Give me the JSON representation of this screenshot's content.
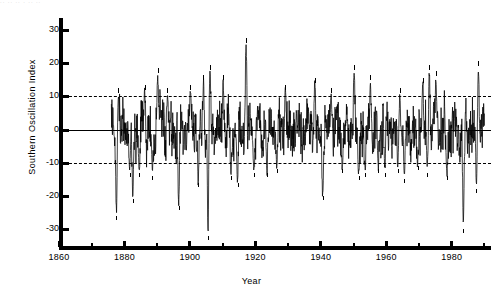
{
  "figure": {
    "top_artifact_text": "·· ·· ·· · ·· ··",
    "xlabel": "Year",
    "ylabel": "Southern Oscillation Index"
  },
  "axes": {
    "y_ticks": [
      {
        "value": 30,
        "label": "30"
      },
      {
        "value": 20,
        "label": "20"
      },
      {
        "value": 10,
        "label": "10"
      },
      {
        "value": 0,
        "label": "0"
      },
      {
        "value": -10,
        "label": "-10"
      },
      {
        "value": -20,
        "label": "-20"
      },
      {
        "value": -30,
        "label": "-30"
      }
    ],
    "x_ticks_major": [
      {
        "value": 1860,
        "label": "1860"
      },
      {
        "value": 1880,
        "label": "1880"
      },
      {
        "value": 1900,
        "label": "1900"
      },
      {
        "value": 1920,
        "label": "1920"
      },
      {
        "value": 1940,
        "label": "1940"
      },
      {
        "value": 1960,
        "label": "1960"
      },
      {
        "value": 1980,
        "label": "1980"
      }
    ],
    "x_ticks_minor": [
      1870,
      1890,
      1910,
      1930,
      1950,
      1970,
      1990
    ]
  },
  "chart_data": {
    "type": "line",
    "title": "",
    "xlabel": "Year",
    "ylabel": "Southern Oscillation Index",
    "xlim": [
      1860,
      1992
    ],
    "ylim": [
      -35,
      32
    ],
    "grid": false,
    "legend": null,
    "reference_lines": [
      {
        "y": 10,
        "style": "dashed",
        "label": "+10"
      },
      {
        "y": 0,
        "style": "solid",
        "label": "0"
      },
      {
        "y": -10,
        "style": "dashed",
        "label": "-10"
      }
    ],
    "data_start_year": 1876,
    "data_end_year": 1990,
    "series": [
      {
        "name": "Southern Oscillation Index",
        "color": "#000000",
        "description": "Monthly SOI anomaly time series, 1876-1990",
        "annotations_positive": [
          {
            "label": "78",
            "year": 1878,
            "value": 11
          },
          {
            "label": "86",
            "year": 1886,
            "value": 12
          },
          {
            "label": "90",
            "year": 1890,
            "value": 17
          },
          {
            "label": "93",
            "year": 1893,
            "value": 11
          },
          {
            "label": "00",
            "year": 1900,
            "value": 12
          },
          {
            "label": "04",
            "year": 1904,
            "value": 15
          },
          {
            "label": "06",
            "year": 1906,
            "value": 18
          },
          {
            "label": "10",
            "year": 1910,
            "value": 15
          },
          {
            "label": "17",
            "year": 1917,
            "value": 26
          },
          {
            "label": "29",
            "year": 1929,
            "value": 12
          },
          {
            "label": "38",
            "year": 1938,
            "value": 14
          },
          {
            "label": "43",
            "year": 1943,
            "value": 11
          },
          {
            "label": "50",
            "year": 1950,
            "value": 18
          },
          {
            "label": "55",
            "year": 1955,
            "value": 15
          },
          {
            "label": "64",
            "year": 1964,
            "value": 11
          },
          {
            "label": "71",
            "year": 1971,
            "value": 14
          },
          {
            "label": "73",
            "year": 1973,
            "value": 18
          },
          {
            "label": "75",
            "year": 1975,
            "value": 16
          },
          {
            "label": "88",
            "year": 1988,
            "value": 19
          }
        ],
        "annotations_negative": [
          {
            "label": "77",
            "year": 1877,
            "value": -26
          },
          {
            "label": "81",
            "year": 1881,
            "value": -13
          },
          {
            "label": "82",
            "year": 1882,
            "value": -21
          },
          {
            "label": "84",
            "year": 1884,
            "value": -13
          },
          {
            "label": "88",
            "year": 1888,
            "value": -14
          },
          {
            "label": "96",
            "year": 1896,
            "value": -23
          },
          {
            "label": "02",
            "year": 1902,
            "value": -16
          },
          {
            "label": "05",
            "year": 1905,
            "value": -32
          },
          {
            "label": "12",
            "year": 1912,
            "value": -14
          },
          {
            "label": "14",
            "year": 1914,
            "value": -16
          },
          {
            "label": "19",
            "year": 1919,
            "value": -13
          },
          {
            "label": "23",
            "year": 1923,
            "value": -13
          },
          {
            "label": "26",
            "year": 1926,
            "value": -12
          },
          {
            "label": "40",
            "year": 1940,
            "value": -20
          },
          {
            "label": "46",
            "year": 1946,
            "value": -12
          },
          {
            "label": "51",
            "year": 1951,
            "value": -14
          },
          {
            "label": "53",
            "year": 1953,
            "value": -13
          },
          {
            "label": "57",
            "year": 1957,
            "value": -12
          },
          {
            "label": "59",
            "year": 1959,
            "value": -13
          },
          {
            "label": "63",
            "year": 1963,
            "value": -12
          },
          {
            "label": "65",
            "year": 1965,
            "value": -15
          },
          {
            "label": "69",
            "year": 1969,
            "value": -11
          },
          {
            "label": "72",
            "year": 1972,
            "value": -13
          },
          {
            "label": "78",
            "year": 1978,
            "value": -14
          },
          {
            "label": "83",
            "year": 1983,
            "value": -30
          },
          {
            "label": "87",
            "year": 1987,
            "value": -18
          }
        ]
      }
    ]
  }
}
